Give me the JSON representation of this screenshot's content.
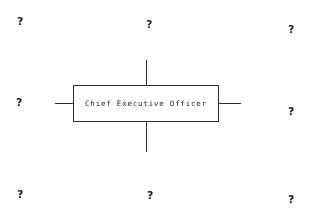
{
  "diagram": {
    "type": "organizational-chart-fragment",
    "background_color": "#ffffff",
    "line_color": "#2b2b2b",
    "text_color": "#1f1f1f",
    "root_box": {
      "label": "Chief Executive Officer"
    },
    "connectors": [
      {
        "name": "top",
        "direction": "up"
      },
      {
        "name": "bottom",
        "direction": "down"
      },
      {
        "name": "left",
        "direction": "left"
      },
      {
        "name": "right",
        "direction": "right"
      }
    ],
    "placeholders": [
      {
        "position": "top-left",
        "label": "?"
      },
      {
        "position": "top-center",
        "label": "?"
      },
      {
        "position": "top-right",
        "label": "?"
      },
      {
        "position": "middle-left",
        "label": "?"
      },
      {
        "position": "middle-right",
        "label": "?"
      },
      {
        "position": "bottom-left",
        "label": "?"
      },
      {
        "position": "bottom-center",
        "label": "?"
      },
      {
        "position": "bottom-right",
        "label": "?"
      }
    ]
  }
}
